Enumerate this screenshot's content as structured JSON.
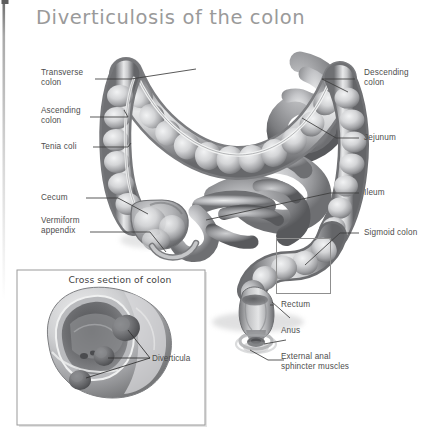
{
  "figure": {
    "title": "Diverticulosis of the colon",
    "title_color": "#9a9a9a",
    "background": "#ffffff",
    "label_color": "#4d4d4d",
    "leader_color": "#3c3c3c",
    "illustration_style": "grayscale airbrush medical illustration"
  },
  "labels_left": [
    {
      "name": "transverse-colon",
      "text": "Transverse\ncolon"
    },
    {
      "name": "ascending-colon",
      "text": "Ascending\ncolon"
    },
    {
      "name": "tenia-coli",
      "text": "Tenia coli"
    },
    {
      "name": "cecum",
      "text": "Cecum"
    },
    {
      "name": "vermiform-appendix",
      "text": "Vermiform\nappendix"
    }
  ],
  "labels_right": [
    {
      "name": "descending-colon",
      "text": "Descending\ncolon"
    },
    {
      "name": "jejunum",
      "text": "Jejunum"
    },
    {
      "name": "ileum",
      "text": "Ileum"
    },
    {
      "name": "sigmoid-colon",
      "text": "Sigmoid colon"
    },
    {
      "name": "rectum",
      "text": "Rectum"
    },
    {
      "name": "anus",
      "text": "Anus"
    },
    {
      "name": "external-anal-sphincter",
      "text": "External anal\nsphincter muscles"
    }
  ],
  "inset": {
    "title": "Cross section of colon",
    "callout_label": "Diverticula",
    "border_color": "#9a9a9a"
  },
  "callout_box": {
    "name": "sigmoid-colon-highlight-box",
    "border_color": "#8f8f8f"
  }
}
